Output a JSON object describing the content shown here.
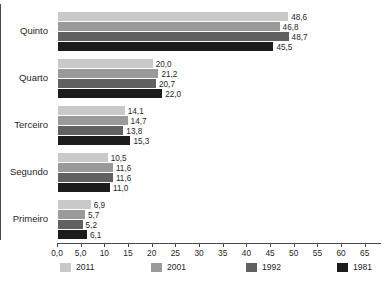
{
  "chart_data": {
    "type": "bar",
    "orientation": "horizontal",
    "title": "",
    "subtitle": "",
    "xlabel": "",
    "ylabel": "",
    "grid": false,
    "legend_position": "bottom",
    "xlim": [
      0,
      68
    ],
    "categories": [
      "Quinto",
      "Quarto",
      "Terceiro",
      "Segundo",
      "Primeiro"
    ],
    "tick_labels": [
      "0,0",
      "5,0",
      "10",
      "15",
      "20",
      "25",
      "30",
      "35",
      "40",
      "45",
      "50",
      "55",
      "60",
      "65"
    ],
    "tick_values": [
      0,
      5,
      10,
      15,
      20,
      25,
      30,
      35,
      40,
      45,
      50,
      55,
      60,
      65
    ],
    "series": [
      {
        "name": "2011",
        "color": "#c9c9c9",
        "values": [
          48.6,
          20.0,
          14.1,
          10.5,
          6.9
        ],
        "labels": [
          "48,6",
          "20,0",
          "14,1",
          "10,5",
          "6,9"
        ]
      },
      {
        "name": "2001",
        "color": "#9a9a9a",
        "values": [
          46.8,
          21.2,
          14.7,
          11.6,
          5.7
        ],
        "labels": [
          "46,8",
          "21,2",
          "14,7",
          "11,6",
          "5,7"
        ]
      },
      {
        "name": "1992",
        "color": "#616161",
        "values": [
          48.7,
          20.7,
          13.8,
          11.6,
          5.2
        ],
        "labels": [
          "48,7",
          "20,7",
          "13,8",
          "11,6",
          "5,2"
        ]
      },
      {
        "name": "1981",
        "color": "#1c1c1c",
        "values": [
          45.5,
          22.0,
          15.3,
          11.0,
          6.1
        ],
        "labels": [
          "45,5",
          "22,0",
          "15,3",
          "11,0",
          "6,1"
        ]
      }
    ]
  }
}
